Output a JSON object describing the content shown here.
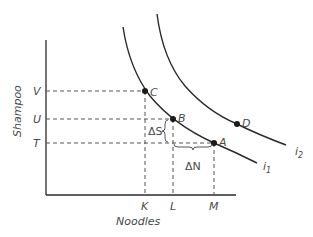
{
  "diagram": {
    "axes": {
      "x_label": "Noodles",
      "y_label": "Shampoo"
    },
    "y_ticks": [
      {
        "label": "V",
        "y": 91
      },
      {
        "label": "U",
        "y": 119
      },
      {
        "label": "T",
        "y": 143
      }
    ],
    "x_ticks": [
      {
        "label": "K",
        "x": 145
      },
      {
        "label": "L",
        "x": 173
      },
      {
        "label": "M",
        "x": 214
      }
    ],
    "points": {
      "A": {
        "label": "A"
      },
      "B": {
        "label": "B"
      },
      "C": {
        "label": "C"
      },
      "D": {
        "label": "D"
      }
    },
    "curves": {
      "i1": {
        "label": "i",
        "subscript": "1"
      },
      "i2": {
        "label": "i",
        "subscript": "2"
      }
    },
    "annotations": {
      "delta_s": "ΔS",
      "delta_n": "ΔN"
    },
    "colors": {
      "line": "#2a2a2a",
      "dashed": "#555555",
      "text": "#4a4a4a"
    }
  }
}
